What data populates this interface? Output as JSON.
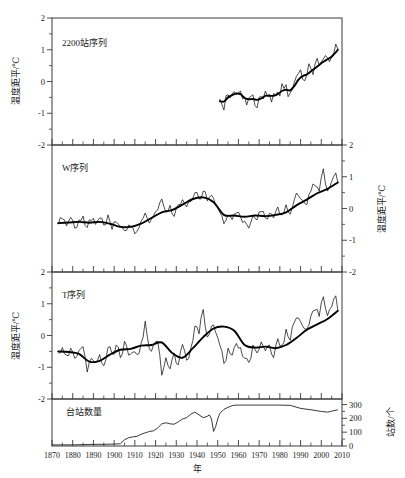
{
  "figure": {
    "x_axis_title": "年",
    "x_ticks": [
      1870,
      1880,
      1890,
      1900,
      1910,
      1920,
      1930,
      1940,
      1950,
      1960,
      1970,
      1980,
      1990,
      2000,
      2010
    ],
    "x_range": [
      1870,
      2010
    ]
  },
  "panels": {
    "p1": {
      "label": "2200站序列",
      "y_axis_title": "温度距平/℃",
      "y_axis_side": "left",
      "y_ticks": [
        2,
        1,
        0,
        -1,
        -2
      ],
      "y_range": [
        -2,
        2
      ]
    },
    "p2": {
      "label": "W序列",
      "y_axis_title": "温度距平/℃",
      "y_axis_side": "right",
      "y_ticks": [
        2,
        1,
        0,
        -1,
        -2
      ],
      "y_range": [
        -2,
        2
      ]
    },
    "p3": {
      "label": "T序列",
      "y_axis_title": "温度距平/℃",
      "y_axis_side": "left",
      "y_ticks": [
        2,
        1,
        0,
        -1,
        -2
      ],
      "y_range": [
        -2,
        2
      ]
    },
    "p4": {
      "label": "台站数量",
      "y_axis_title": "站数/个",
      "y_axis_side": "right",
      "y_ticks": [
        0,
        100,
        200,
        300
      ],
      "y_range": [
        0,
        340
      ]
    }
  },
  "chart_data": [
    {
      "type": "line",
      "title": "2200站序列",
      "xlabel": "年",
      "ylabel": "温度距平/℃",
      "xlim": [
        1870,
        2010
      ],
      "ylim": [
        -2,
        2
      ],
      "grid": false,
      "legend": "none",
      "series": [
        {
          "name": "annual",
          "x": [
            1951,
            1952,
            1953,
            1954,
            1955,
            1956,
            1957,
            1958,
            1959,
            1960,
            1961,
            1962,
            1963,
            1964,
            1965,
            1966,
            1967,
            1968,
            1969,
            1970,
            1971,
            1972,
            1973,
            1974,
            1975,
            1976,
            1977,
            1978,
            1979,
            1980,
            1981,
            1982,
            1983,
            1984,
            1985,
            1986,
            1987,
            1988,
            1989,
            1990,
            1991,
            1992,
            1993,
            1994,
            1995,
            1996,
            1997,
            1998,
            1999,
            2000,
            2001,
            2002,
            2003,
            2004,
            2005,
            2006,
            2007,
            2008
          ],
          "values": [
            -0.55,
            -0.72,
            -0.9,
            -0.45,
            -0.42,
            -0.52,
            -0.38,
            -0.32,
            -0.41,
            -0.36,
            -0.3,
            -0.55,
            -0.49,
            -0.74,
            -0.52,
            -0.47,
            -0.42,
            -0.76,
            -0.83,
            -0.5,
            -0.47,
            -0.55,
            -0.3,
            -0.46,
            -0.41,
            -0.65,
            -0.38,
            -0.42,
            -0.33,
            -0.46,
            -0.07,
            -0.22,
            -0.1,
            -0.48,
            -0.36,
            -0.26,
            -0.02,
            0.16,
            0.26,
            0.37,
            0.07,
            0.02,
            0.2,
            0.56,
            0.41,
            0.22,
            0.55,
            0.73,
            0.51,
            0.62,
            0.71,
            0.82,
            0.74,
            0.62,
            0.8,
            0.88,
            1.18,
            1.02
          ]
        },
        {
          "name": "smoothed",
          "x": [
            1951,
            1953,
            1955,
            1957,
            1959,
            1961,
            1963,
            1965,
            1967,
            1969,
            1971,
            1973,
            1975,
            1977,
            1979,
            1981,
            1983,
            1985,
            1987,
            1989,
            1991,
            1993,
            1995,
            1997,
            1999,
            2001,
            2003,
            2005,
            2007,
            2008
          ],
          "values": [
            -0.62,
            -0.63,
            -0.5,
            -0.43,
            -0.38,
            -0.4,
            -0.52,
            -0.56,
            -0.55,
            -0.58,
            -0.53,
            -0.45,
            -0.45,
            -0.45,
            -0.4,
            -0.3,
            -0.26,
            -0.28,
            -0.14,
            0.06,
            0.17,
            0.22,
            0.32,
            0.42,
            0.52,
            0.62,
            0.7,
            0.78,
            0.92,
            1.0
          ]
        }
      ]
    },
    {
      "type": "line",
      "title": "W序列",
      "xlabel": "年",
      "ylabel": "温度距平/℃",
      "xlim": [
        1870,
        2010
      ],
      "ylim": [
        -2,
        2
      ],
      "grid": false,
      "legend": "none",
      "series": [
        {
          "name": "annual",
          "x": [
            1873,
            1875,
            1877,
            1879,
            1881,
            1883,
            1885,
            1887,
            1889,
            1891,
            1893,
            1895,
            1897,
            1899,
            1901,
            1903,
            1905,
            1907,
            1909,
            1911,
            1913,
            1915,
            1917,
            1919,
            1921,
            1923,
            1925,
            1927,
            1929,
            1931,
            1933,
            1935,
            1937,
            1939,
            1941,
            1943,
            1945,
            1947,
            1949,
            1951,
            1953,
            1955,
            1957,
            1959,
            1961,
            1963,
            1965,
            1967,
            1969,
            1971,
            1973,
            1975,
            1977,
            1979,
            1981,
            1983,
            1985,
            1987,
            1989,
            1991,
            1993,
            1995,
            1997,
            1999,
            2001,
            2003,
            2005,
            2007,
            2008
          ],
          "values": [
            -0.5,
            -0.32,
            -0.55,
            -0.28,
            -0.62,
            -0.36,
            -0.24,
            -0.6,
            -0.38,
            -0.5,
            -0.3,
            -0.52,
            -0.2,
            -0.66,
            -0.42,
            -0.56,
            -0.7,
            -0.52,
            -0.6,
            -0.72,
            -0.4,
            -0.14,
            -0.46,
            -0.22,
            -0.05,
            0.3,
            -0.12,
            0.1,
            -0.25,
            0.12,
            0.28,
            0.05,
            0.22,
            0.5,
            0.3,
            0.55,
            0.24,
            0.42,
            0.1,
            -0.12,
            -0.48,
            -0.2,
            -0.35,
            -0.14,
            -0.26,
            -0.4,
            -0.62,
            -0.22,
            -0.36,
            -0.1,
            -0.3,
            -0.15,
            -0.3,
            0.05,
            -0.2,
            0.12,
            -0.18,
            0.28,
            0.4,
            0.25,
            0.12,
            0.55,
            0.72,
            0.55,
            1.25,
            0.55,
            0.85,
            1.12,
            0.82
          ]
        },
        {
          "name": "smoothed",
          "x": [
            1873,
            1878,
            1883,
            1888,
            1893,
            1898,
            1903,
            1908,
            1913,
            1918,
            1923,
            1928,
            1933,
            1938,
            1943,
            1948,
            1953,
            1958,
            1963,
            1968,
            1973,
            1978,
            1983,
            1988,
            1993,
            1998,
            2003,
            2008
          ],
          "values": [
            -0.46,
            -0.44,
            -0.42,
            -0.45,
            -0.42,
            -0.48,
            -0.58,
            -0.58,
            -0.48,
            -0.3,
            -0.12,
            -0.05,
            0.12,
            0.3,
            0.35,
            0.2,
            -0.2,
            -0.22,
            -0.26,
            -0.22,
            -0.24,
            -0.2,
            -0.12,
            0.1,
            0.28,
            0.48,
            0.62,
            0.82
          ]
        }
      ]
    },
    {
      "type": "line",
      "title": "T序列",
      "xlabel": "年",
      "ylabel": "温度距平/℃",
      "xlim": [
        1870,
        2010
      ],
      "ylim": [
        -2,
        2
      ],
      "grid": false,
      "legend": "none",
      "series": [
        {
          "name": "annual",
          "x": [
            1873,
            1875,
            1877,
            1879,
            1881,
            1883,
            1885,
            1887,
            1889,
            1891,
            1893,
            1895,
            1897,
            1899,
            1901,
            1903,
            1905,
            1907,
            1909,
            1911,
            1913,
            1915,
            1917,
            1919,
            1921,
            1923,
            1925,
            1927,
            1929,
            1931,
            1933,
            1935,
            1937,
            1939,
            1941,
            1943,
            1945,
            1947,
            1949,
            1951,
            1953,
            1955,
            1957,
            1959,
            1961,
            1963,
            1965,
            1967,
            1969,
            1971,
            1973,
            1975,
            1977,
            1979,
            1981,
            1983,
            1985,
            1987,
            1989,
            1991,
            1993,
            1995,
            1997,
            1999,
            2001,
            2003,
            2005,
            2007,
            2008
          ],
          "values": [
            -0.55,
            -0.38,
            -0.62,
            -0.4,
            -0.72,
            -0.48,
            -0.35,
            -1.15,
            -0.72,
            -0.85,
            -0.6,
            -0.95,
            -0.38,
            -0.58,
            -0.3,
            -0.7,
            -0.18,
            -0.62,
            -0.52,
            -0.6,
            -0.25,
            0.45,
            -0.42,
            -0.3,
            -0.18,
            -1.25,
            -0.7,
            -1.05,
            -0.55,
            -0.92,
            -0.28,
            -0.78,
            -0.4,
            0.3,
            0.05,
            0.82,
            -0.05,
            0.3,
            0.1,
            -0.3,
            -0.88,
            -0.4,
            -0.62,
            -0.25,
            -0.38,
            -0.72,
            -0.85,
            -0.3,
            -0.55,
            -0.2,
            -0.48,
            -0.3,
            -0.7,
            -0.1,
            -0.32,
            0.2,
            -0.15,
            0.42,
            0.55,
            0.3,
            0.2,
            0.62,
            0.8,
            0.6,
            1.22,
            0.62,
            0.9,
            1.25,
            0.78
          ]
        },
        {
          "name": "smoothed",
          "x": [
            1873,
            1878,
            1883,
            1888,
            1893,
            1898,
            1903,
            1908,
            1913,
            1918,
            1923,
            1928,
            1933,
            1938,
            1943,
            1948,
            1953,
            1958,
            1963,
            1968,
            1973,
            1978,
            1983,
            1988,
            1993,
            1998,
            2003,
            2008
          ],
          "values": [
            -0.5,
            -0.52,
            -0.58,
            -0.82,
            -0.8,
            -0.6,
            -0.45,
            -0.42,
            -0.32,
            -0.3,
            -0.22,
            -0.55,
            -0.7,
            -0.4,
            -0.05,
            0.22,
            0.28,
            0.15,
            -0.3,
            -0.38,
            -0.35,
            -0.4,
            -0.3,
            -0.08,
            0.18,
            0.35,
            0.52,
            0.78
          ]
        }
      ]
    },
    {
      "type": "line",
      "title": "台站数量",
      "xlabel": "年",
      "ylabel": "站数/个",
      "xlim": [
        1870,
        2010
      ],
      "ylim": [
        0,
        340
      ],
      "grid": false,
      "legend": "none",
      "series": [
        {
          "name": "station_count",
          "x": [
            1870,
            1875,
            1880,
            1885,
            1890,
            1895,
            1900,
            1903,
            1905,
            1907,
            1909,
            1911,
            1913,
            1915,
            1917,
            1919,
            1921,
            1923,
            1925,
            1927,
            1929,
            1931,
            1933,
            1935,
            1937,
            1939,
            1941,
            1943,
            1945,
            1946,
            1947,
            1948,
            1949,
            1950,
            1951,
            1953,
            1955,
            1957,
            1959,
            1961,
            1963,
            1970,
            1980,
            1985,
            1990,
            1995,
            2000,
            2003,
            2005,
            2008
          ],
          "values": [
            8,
            8,
            8,
            10,
            12,
            12,
            14,
            16,
            45,
            60,
            66,
            70,
            85,
            95,
            105,
            110,
            130,
            160,
            168,
            160,
            158,
            175,
            195,
            205,
            230,
            245,
            225,
            205,
            215,
            225,
            195,
            105,
            140,
            195,
            235,
            265,
            280,
            292,
            296,
            296,
            296,
            296,
            296,
            294,
            272,
            262,
            250,
            245,
            252,
            262
          ]
        }
      ]
    }
  ]
}
